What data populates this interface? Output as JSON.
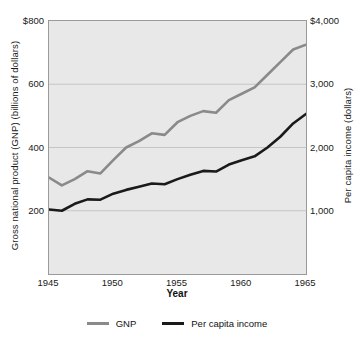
{
  "chart_data": {
    "type": "line",
    "title": "",
    "xlabel": "Year",
    "ylabel_left": "Gross national product (GNP) (billions of dollars)",
    "ylabel_right": "Per capita income (dollars)",
    "grid": true,
    "legend_position": "bottom",
    "x": [
      1945,
      1946,
      1947,
      1948,
      1949,
      1950,
      1951,
      1952,
      1953,
      1954,
      1955,
      1956,
      1957,
      1958,
      1959,
      1960,
      1961,
      1962,
      1963,
      1964,
      1965
    ],
    "xlim": [
      1945,
      1965
    ],
    "xticks": [
      1945,
      1950,
      1955,
      1960,
      1965
    ],
    "xtick_labels": [
      "1945",
      "1950",
      "1955",
      "1960",
      "1965"
    ],
    "left_axis": {
      "ylim": [
        0,
        800
      ],
      "yticks": [
        200,
        400,
        600,
        800
      ],
      "ytick_labels": [
        "200",
        "400",
        "600",
        "$800"
      ]
    },
    "right_axis": {
      "ylim": [
        0,
        4000
      ],
      "yticks": [
        1000,
        2000,
        3000,
        4000
      ],
      "ytick_labels": [
        "1,000",
        "2,000",
        "3,000",
        "$4,000"
      ]
    },
    "series": [
      {
        "name": "GNP",
        "axis": "left",
        "color": "#8a8a8a",
        "values": [
          305,
          280,
          300,
          325,
          318,
          360,
          400,
          420,
          445,
          440,
          480,
          500,
          515,
          510,
          550,
          570,
          590,
          630,
          670,
          710,
          725
        ]
      },
      {
        "name": "Per capita income",
        "axis": "right",
        "color": "#1a1a1a",
        "values": [
          1020,
          1000,
          1110,
          1180,
          1175,
          1270,
          1330,
          1380,
          1430,
          1420,
          1500,
          1570,
          1630,
          1620,
          1730,
          1800,
          1860,
          2000,
          2170,
          2380,
          2530
        ]
      }
    ],
    "legend": [
      {
        "label": "GNP",
        "color": "#8a8a8a"
      },
      {
        "label": "Per capita income",
        "color": "#1a1a1a"
      }
    ]
  },
  "colors": {
    "gnp": "#8a8a8a",
    "per_capita": "#1a1a1a",
    "plot_background": "#e8e8e8",
    "grid": "#c5c5c5",
    "frame": "#9a9a9a",
    "page_background": "#ffffff"
  }
}
